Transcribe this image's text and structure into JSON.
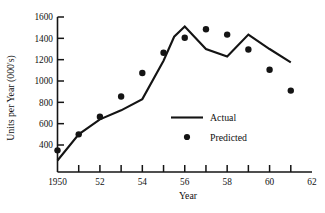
{
  "chart_data": {
    "type": "line",
    "title": "",
    "xlabel": "Year",
    "ylabel": "Units per Year (000's)",
    "xlim": [
      1950,
      1962
    ],
    "ylim": [
      250,
      1600
    ],
    "grid": false,
    "legend_position": "center-right-inside",
    "x_tick_labels": [
      "1950",
      "52",
      "54",
      "56",
      "58",
      "60",
      "62"
    ],
    "x_tick_values": [
      1950,
      1952,
      1954,
      1956,
      1958,
      1960,
      1962
    ],
    "x_minor_ticks": [
      1951,
      1953,
      1955,
      1957,
      1959,
      1961
    ],
    "y_tick_labels": [
      "1600",
      "1400",
      "1200",
      "1000",
      "800",
      "600",
      "400"
    ],
    "y_tick_values": [
      1600,
      1400,
      1200,
      1000,
      800,
      600,
      400
    ],
    "series": [
      {
        "name": "Actual",
        "marker": "line",
        "x": [
          1950.0,
          1951.0,
          1952.0,
          1953.0,
          1954.0,
          1955.0,
          1955.5,
          1956.0,
          1957.0,
          1958.0,
          1959.0,
          1960.0,
          1961.0
        ],
        "values": [
          255,
          500,
          640,
          725,
          830,
          1190,
          1415,
          1510,
          1300,
          1230,
          1435,
          1300,
          1175
        ]
      },
      {
        "name": "Predicted",
        "marker": "dot",
        "x": [
          1950,
          1951,
          1952,
          1953,
          1954,
          1955,
          1956,
          1957,
          1958,
          1959,
          1960,
          1961
        ],
        "values": [
          350,
          500,
          665,
          855,
          1075,
          1265,
          1405,
          1485,
          1435,
          1295,
          1105,
          910
        ]
      }
    ]
  },
  "legend": {
    "actual_label": "Actual",
    "predicted_label": "Predicted"
  },
  "axes": {
    "x_title": "Year",
    "y_title": "Units per Year (000's)"
  },
  "colors": {
    "line": "#141414",
    "marker": "#141414",
    "axis": "#141414",
    "background": "#ffffff"
  }
}
